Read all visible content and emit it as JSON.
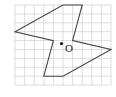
{
  "figure": {
    "grid": {
      "columns": 10,
      "rows": 9
    },
    "polygon": {
      "description": "pinwheel-like shape on grid",
      "vertices_grid": [
        [
          5,
          0
        ],
        [
          7,
          0
        ],
        [
          6,
          4
        ],
        [
          10,
          5
        ],
        [
          5,
          8
        ],
        [
          3,
          8
        ],
        [
          4,
          4
        ],
        [
          0,
          3
        ]
      ]
    },
    "center_point": {
      "label": "O",
      "grid": [
        5,
        4
      ]
    }
  }
}
